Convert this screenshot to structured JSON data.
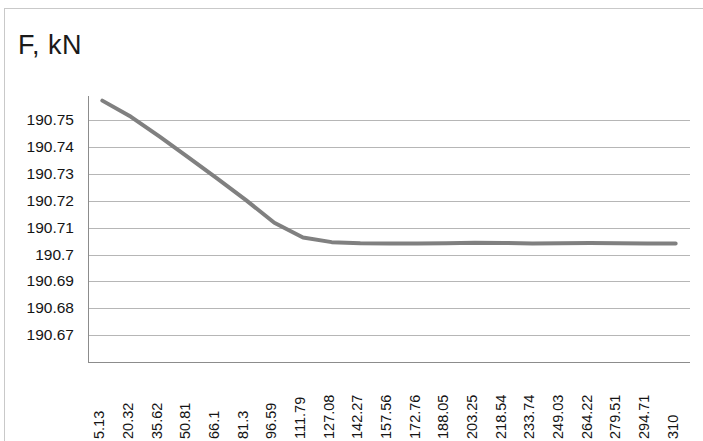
{
  "chart_data": {
    "type": "line",
    "title": "F, kN",
    "xlabel": "",
    "ylabel": "",
    "ylim": [
      190.67,
      190.76
    ],
    "yticks": [
      "190.67",
      "190.68",
      "190.69",
      "190.7",
      "190.71",
      "190.72",
      "190.73",
      "190.74",
      "190.75"
    ],
    "ytick_values": [
      190.67,
      190.68,
      190.69,
      190.7,
      190.71,
      190.72,
      190.73,
      190.74,
      190.75
    ],
    "grid": "horizontal",
    "legend": "none",
    "line_color": "#808080",
    "line_width": 4,
    "categories": [
      "5.13",
      "20.32",
      "35.62",
      "50.81",
      "66.1",
      "81.3",
      "96.59",
      "111.79",
      "127.08",
      "142.27",
      "157.56",
      "172.76",
      "188.05",
      "203.25",
      "218.54",
      "233.74",
      "249.03",
      "264.22",
      "279.51",
      "294.71",
      "310"
    ],
    "values": [
      190.7572,
      190.7512,
      190.7438,
      190.7361,
      190.7283,
      190.7203,
      190.7118,
      190.7063,
      190.7046,
      190.7042,
      190.7041,
      190.7041,
      190.7042,
      190.7044,
      190.7043,
      190.7041,
      190.7042,
      190.7043,
      190.7042,
      190.7041,
      190.7041
    ],
    "series": [
      {
        "name": "F",
        "values": [
          190.7572,
          190.7512,
          190.7438,
          190.7361,
          190.7283,
          190.7203,
          190.7118,
          190.7063,
          190.7046,
          190.7042,
          190.7041,
          190.7041,
          190.7042,
          190.7044,
          190.7043,
          190.7041,
          190.7042,
          190.7043,
          190.7042,
          190.7041,
          190.7041
        ]
      }
    ]
  }
}
